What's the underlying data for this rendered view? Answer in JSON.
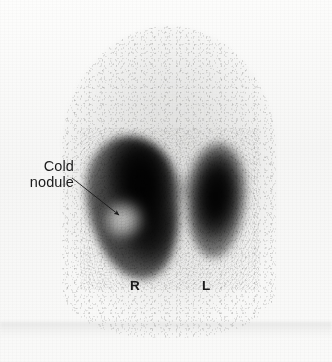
{
  "figure": {
    "modality": "thyroid-scintigraphy",
    "background_color": "#fbfbfa",
    "uptake_color": "#000000"
  },
  "annotations": {
    "nodule_label": "Cold\nnodule",
    "nodule_label_line1": "Cold",
    "nodule_label_line2": "nodule",
    "leader_arrow": {
      "from_x": 72,
      "from_y": 178,
      "to_x": 122,
      "to_y": 218
    }
  },
  "side_markers": {
    "right": "R",
    "left": "L"
  },
  "regions": [
    {
      "name": "right-lobe",
      "label": "R",
      "uptake": "heterogeneous",
      "finding": "cold nodule"
    },
    {
      "name": "left-lobe",
      "label": "L",
      "uptake": "homogeneous",
      "finding": "normal"
    }
  ]
}
